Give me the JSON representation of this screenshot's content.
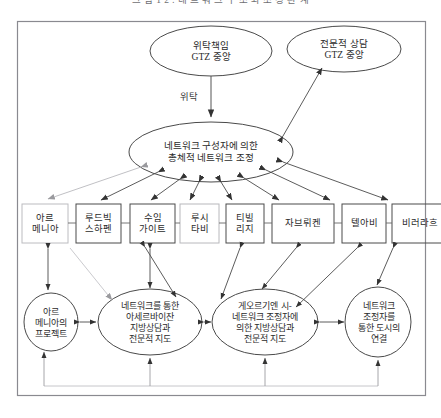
{
  "figure": {
    "title": "그 림 1 2 :  네 트 워 크  구 조 와  조 정  관 계",
    "frame_color": "#8a8a90",
    "line_color": "#4a4a4a",
    "light_line_color": "#b9b9bd",
    "text_color": "#2b2b2b"
  },
  "top_nodes": [
    {
      "id": "wittak-chaekim",
      "line1": "위탁책임",
      "line2": "GTZ 중앙"
    },
    {
      "id": "jeonmunjeok-sangdam",
      "line1": "전문적 상담",
      "line2": "GTZ 중앙"
    }
  ],
  "center_node": {
    "id": "network-coordination",
    "line1": "네트워크 구성자에 의한",
    "line2": "총체적 네트워크 조정"
  },
  "edge_labels": [
    {
      "id": "wittak",
      "text": "위탁"
    }
  ],
  "city_boxes": [
    {
      "id": "armenia",
      "line1": "아르",
      "line2": "메니아",
      "style": "light"
    },
    {
      "id": "ludwigshafen",
      "line1": "루드빅",
      "line2": "스하펜",
      "style": "normal"
    },
    {
      "id": "sumgait",
      "line1": "수임",
      "line2": "가이트",
      "style": "normal"
    },
    {
      "id": "rustavi",
      "line1": "루시",
      "line2": "타비",
      "style": "normal"
    },
    {
      "id": "tbilisi",
      "line1": "티빌",
      "line2": "리지",
      "style": "normal"
    },
    {
      "id": "saarbrucken",
      "line1": "자브뤼켄",
      "line2": "",
      "style": "normal"
    },
    {
      "id": "tel-aviv",
      "line1": "텔아비",
      "line2": "",
      "style": "normal"
    },
    {
      "id": "biberach",
      "line1": "비러라흐",
      "line2": "",
      "style": "normal"
    }
  ],
  "bottom_nodes": [
    {
      "id": "armenia-project",
      "lines": [
        "아르",
        "메니아의",
        "프로젝트"
      ]
    },
    {
      "id": "azerbaijan-advisory",
      "lines": [
        "네트워크를 통한",
        "아세르바이잔",
        "지방상담과",
        "전문적 지도"
      ]
    },
    {
      "id": "georgia-advisory",
      "lines": [
        "게오르기엔 시-",
        "네트워크 조정자에",
        "의한 지방상담과",
        "전문적 지도"
      ]
    },
    {
      "id": "city-linkage",
      "lines": [
        "네트워크",
        "조정자를",
        "통한 도시의",
        "연결"
      ]
    }
  ]
}
